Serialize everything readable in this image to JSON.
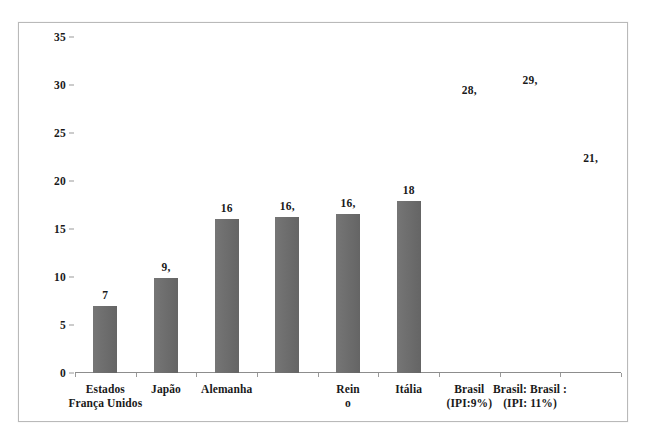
{
  "chart_data": {
    "type": "bar",
    "title": "",
    "xlabel": "",
    "ylabel": "",
    "ylim": [
      0,
      35
    ],
    "yticks": [
      0,
      5,
      10,
      15,
      20,
      25,
      30,
      35
    ],
    "grid": false,
    "legend": "none",
    "bar_color": "#6b6b6b",
    "categories": [
      "França",
      "Japão",
      "Alemanha",
      "Estados Unidos",
      "Reino Unido",
      "Itália",
      "Brasil (IPI:9%)",
      "Brasil: (IPI: 11%)",
      "Brasil :"
    ],
    "category_lines": [
      {
        "line1": "Estados",
        "line2": "França Unidos"
      },
      {
        "line1": "Japão",
        "line2": ""
      },
      {
        "line1": "Alemanha",
        "line2": ""
      },
      {
        "line1": "",
        "line2": ""
      },
      {
        "line1": "Rein",
        "line2": "o"
      },
      {
        "line1": "Itália",
        "line2": ""
      },
      {
        "line1": "Brasil",
        "line2": "(IPI:9%)"
      },
      {
        "line1": "Brasil: Brasil :",
        "line2": "(IPI: 11%)"
      },
      {
        "line1": "",
        "line2": ""
      }
    ],
    "values": [
      7,
      9.9,
      16,
      16.3,
      16.6,
      17.9,
      null,
      null,
      null
    ],
    "data_labels": [
      "7",
      "9,",
      "16",
      "16,",
      "16,",
      "18",
      "28,",
      "29,",
      "21,"
    ],
    "data_label_y": [
      7,
      9.9,
      16,
      16.3,
      16.6,
      17.9,
      28.3,
      29.4,
      21.2
    ],
    "bars_rendered": [
      true,
      true,
      true,
      true,
      true,
      true,
      false,
      false,
      false
    ]
  },
  "axis": {
    "ytick_labels": [
      "0",
      "5",
      "10",
      "15",
      "20",
      "25",
      "30",
      "35"
    ]
  }
}
